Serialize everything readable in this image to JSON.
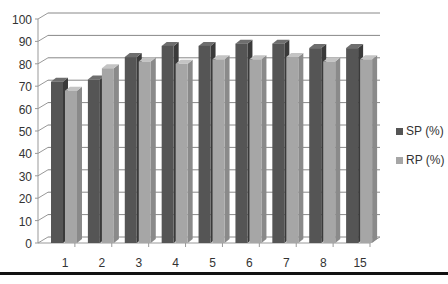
{
  "chart_data": {
    "type": "bar",
    "title": "",
    "xlabel": "",
    "ylabel": "",
    "categories": [
      "1",
      "2",
      "3",
      "4",
      "5",
      "6",
      "7",
      "8",
      "15"
    ],
    "series": [
      {
        "name": "SP (%)",
        "color": "#555555",
        "values": [
          72,
          73,
          83,
          88,
          88,
          89,
          89,
          87,
          87
        ]
      },
      {
        "name": "RP (%)",
        "color": "#a6a6a6",
        "values": [
          68,
          78,
          81,
          80,
          82,
          82,
          83,
          81,
          82
        ]
      }
    ],
    "ylim": [
      0,
      100
    ],
    "yticks": [
      0,
      10,
      20,
      30,
      40,
      50,
      60,
      70,
      80,
      90,
      100
    ],
    "grid": true,
    "style": "3d-clustered-column",
    "legend_position": "right"
  },
  "legend": {
    "items": [
      {
        "label": "SP (%)",
        "color": "#555555"
      },
      {
        "label": "RP (%)",
        "color": "#a6a6a6"
      }
    ]
  }
}
